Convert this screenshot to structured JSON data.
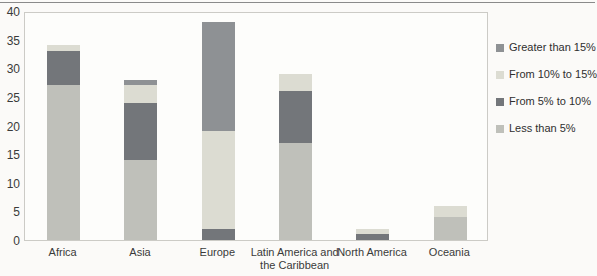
{
  "colors": {
    "less5": "#bfc0ba",
    "f5to10": "#73767a",
    "f10to15": "#dcdcd2",
    "g15": "#8e9194",
    "plot_border": "#cccbc6",
    "axis_text": "#3a3a3a"
  },
  "chart_data": {
    "type": "bar",
    "stacked": true,
    "title": "",
    "xlabel": "",
    "ylabel": "",
    "categories": [
      "Africa",
      "Asia",
      "Europe",
      "Latin America and the Caribbean",
      "North America",
      "Oceania"
    ],
    "series": [
      {
        "name": "Less than 5%",
        "color_key": "less5",
        "values": [
          27,
          14,
          0,
          17,
          0,
          4
        ]
      },
      {
        "name": "From 5% to 10%",
        "color_key": "f5to10",
        "values": [
          6,
          10,
          2,
          9,
          1,
          0
        ]
      },
      {
        "name": "From 10% to 15%",
        "color_key": "f10to15",
        "values": [
          1,
          3,
          17,
          3,
          1,
          2
        ]
      },
      {
        "name": "Greater than 15%",
        "color_key": "g15",
        "values": [
          0,
          1,
          19,
          0,
          0,
          0
        ]
      }
    ],
    "totals": [
      34,
      28,
      38,
      29,
      2,
      6
    ],
    "ylim": [
      0,
      40
    ],
    "ytick_step": 5,
    "ytick_labels": [
      "0",
      "5",
      "10",
      "15",
      "20",
      "25",
      "30",
      "35",
      "40"
    ],
    "grid": false,
    "legend_position": "right",
    "legend_order": [
      "Greater than 15%",
      "From 10% to 15%",
      "From 5% to 10%",
      "Less than 5%"
    ]
  }
}
